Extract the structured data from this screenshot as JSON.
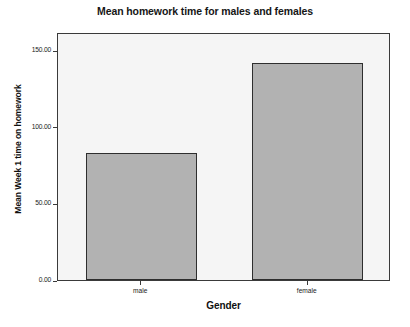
{
  "chart_data": {
    "type": "bar",
    "title": "Mean homework time for males and females",
    "xlabel": "Gender",
    "ylabel": "Mean Week 1 time on homework",
    "categories": [
      "male",
      "female"
    ],
    "values": [
      83,
      142
    ],
    "ylim": [
      0,
      162
    ],
    "yticks": [
      0,
      50,
      100,
      150
    ],
    "ytick_labels": [
      "0.00",
      "50.00",
      "100.00",
      "150.00"
    ],
    "grid": false,
    "legend": false,
    "legend_position": "none",
    "colors": {
      "bar_fill": "#b2b2b2",
      "bar_border": "#2e2e2e",
      "plot_background": "#f5f5f5",
      "frame_border": "#3a3a3a",
      "page_background": "#ffffff",
      "text": "#101010"
    }
  }
}
